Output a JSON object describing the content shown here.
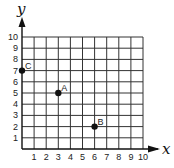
{
  "chart_data": {
    "type": "scatter",
    "title": "",
    "xlabel": "x",
    "ylabel": "y",
    "xlim": [
      0,
      10
    ],
    "ylim": [
      0,
      10
    ],
    "grid": true,
    "x_ticks": [
      "1",
      "2",
      "3",
      "4",
      "5",
      "6",
      "7",
      "8",
      "9",
      "10"
    ],
    "y_ticks": [
      "1",
      "2",
      "3",
      "4",
      "5",
      "6",
      "7",
      "8",
      "9",
      "10"
    ],
    "points": [
      {
        "label": "A",
        "x": 3,
        "y": 5
      },
      {
        "label": "B",
        "x": 6,
        "y": 2
      },
      {
        "label": "C",
        "x": 0,
        "y": 7
      }
    ]
  }
}
